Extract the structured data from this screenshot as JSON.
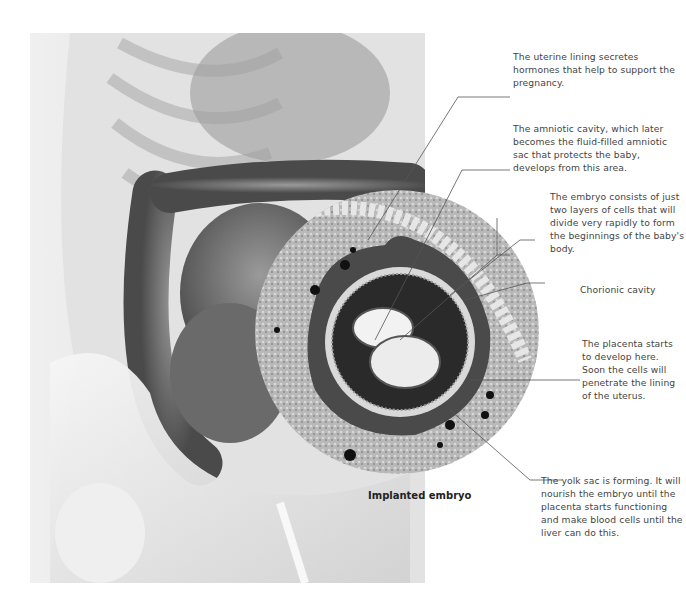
{
  "figure": {
    "caption": "Implanted embryo",
    "annotations": [
      {
        "id": "uterine-lining",
        "text": "The uterine lining secretes hormones that help to support the pregnancy."
      },
      {
        "id": "amniotic-cavity",
        "text": "The amniotic cavity, which later becomes the fluid-filled amniotic sac that protects the baby, develops from this area."
      },
      {
        "id": "embryo-layers",
        "text": "The embryo consists of just two layers of cells that will divide very rapidly to form the beginnings of the baby's body."
      },
      {
        "id": "chorionic-cavity",
        "text": "Chorionic cavity"
      },
      {
        "id": "placenta",
        "text": "The placenta starts to develop here. Soon the cells will penetrate the lining of the uterus."
      },
      {
        "id": "yolk-sac",
        "text": "The yolk sac is forming. It will nourish the embryo until the placenta starts functioning and make blood cells until the liver can do this."
      }
    ]
  },
  "colors": {
    "background": "#ffffff",
    "text": "#444444",
    "leader": "#555555",
    "tissue_dark": "#2a2a2a",
    "tissue_mid": "#8a8a8a",
    "tissue_light": "#c8c8c8"
  }
}
